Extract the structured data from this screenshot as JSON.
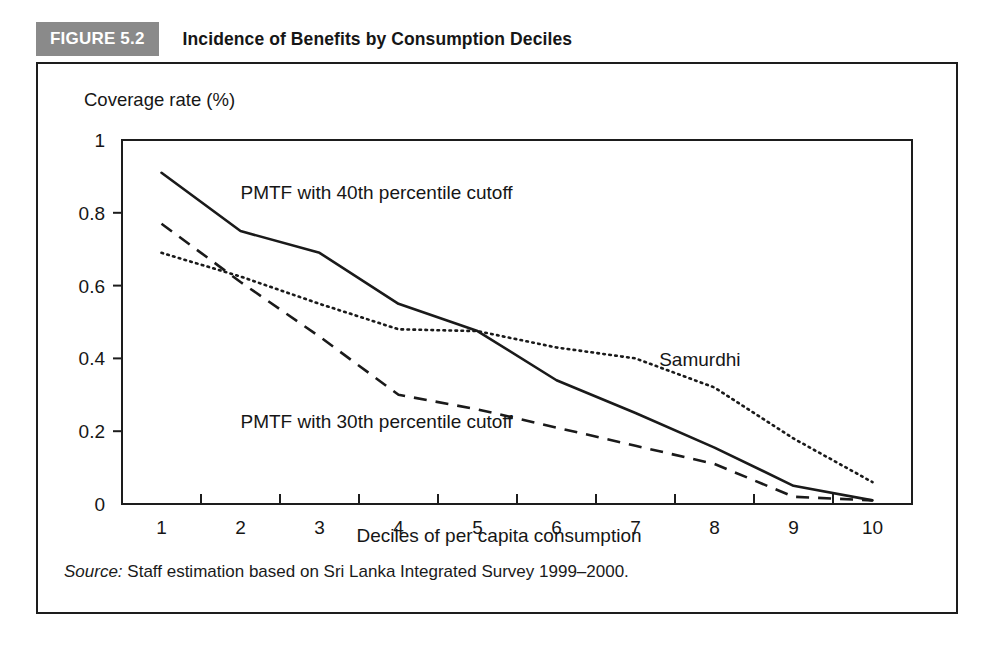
{
  "figure": {
    "badge_label": "FIGURE 5.2",
    "title": "Incidence of Benefits by Consumption Deciles",
    "badge_color": "#8a8a8a",
    "badge_text_color": "#ffffff",
    "frame_color": "#1d1d1d"
  },
  "source": {
    "label": "Source:",
    "text": "Staff estimation based on Sri Lanka Integrated Survey 1999–2000."
  },
  "chart_data": {
    "type": "line",
    "title": "Incidence of Benefits by Consumption Deciles",
    "xlabel": "Deciles of per capita consumption",
    "ylabel": "Coverage rate (%)",
    "categories": [
      "1",
      "2",
      "3",
      "4",
      "5",
      "6",
      "7",
      "8",
      "9",
      "10"
    ],
    "x": [
      1,
      2,
      3,
      4,
      5,
      6,
      7,
      8,
      9,
      10
    ],
    "xlim": [
      0.5,
      10.5
    ],
    "ylim": [
      0,
      1
    ],
    "yticks": [
      0,
      0.2,
      0.4,
      0.6,
      0.8,
      1
    ],
    "ytick_labels": [
      "0",
      "0.2",
      "0.4",
      "0.6",
      "0.8",
      "1"
    ],
    "grid": false,
    "legend_position": "inline-annotations",
    "series": [
      {
        "name": "PMTF with 40th percentile cutoff",
        "style": "solid",
        "color": "#1a1a1a",
        "values": [
          0.91,
          0.75,
          0.69,
          0.55,
          0.475,
          0.34,
          0.25,
          0.155,
          0.05,
          0.01
        ]
      },
      {
        "name": "PMTF with 30th percentile cutoff",
        "style": "dashed",
        "color": "#1a1a1a",
        "values": [
          0.77,
          0.61,
          0.46,
          0.3,
          0.26,
          0.21,
          0.16,
          0.11,
          0.02,
          0.01
        ]
      },
      {
        "name": "Samurdhi",
        "style": "dotted",
        "color": "#1a1a1a",
        "values": [
          0.69,
          0.625,
          0.55,
          0.48,
          0.475,
          0.43,
          0.4,
          0.32,
          0.18,
          0.06
        ]
      }
    ],
    "annotations": [
      {
        "text": "PMTF with 40th percentile cutoff",
        "x": 2.0,
        "y": 0.855
      },
      {
        "text": "PMTF with 30th percentile cutoff",
        "x": 2.0,
        "y": 0.225
      },
      {
        "text": "Samurdhi",
        "x": 7.3,
        "y": 0.395
      }
    ]
  }
}
